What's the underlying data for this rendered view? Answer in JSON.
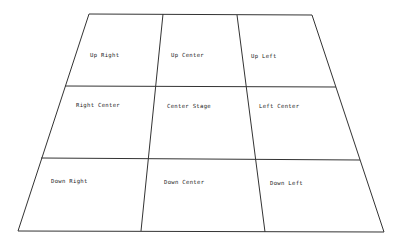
{
  "diagram": {
    "title": "",
    "type": "stage-areas",
    "stroke_color": "#333333",
    "background": "#ffffff",
    "rows": [
      {
        "name": "upstage",
        "cells": [
          {
            "label": "Up Right",
            "x": 87,
            "y": 57
          },
          {
            "label": "Up Center",
            "x": 171,
            "y": 57
          },
          {
            "label": "Up Left",
            "x": 251,
            "y": 58
          }
        ]
      },
      {
        "name": "centerstage",
        "cells": [
          {
            "label": "Right Center",
            "x": 76,
            "y": 107
          },
          {
            "label": "Center Stage",
            "x": 167,
            "y": 108
          },
          {
            "label": "Left Center",
            "x": 259,
            "y": 108
          }
        ]
      },
      {
        "name": "downstage",
        "cells": [
          {
            "label": "Down Right",
            "x": 51,
            "y": 183
          },
          {
            "label": "Down Center",
            "x": 164,
            "y": 184
          },
          {
            "label": "Down Left",
            "x": 270,
            "y": 185
          }
        ]
      }
    ]
  }
}
